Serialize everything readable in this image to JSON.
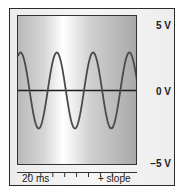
{
  "figure": {
    "vertical_scale": {
      "top_label": "5 V",
      "middle_label": "0 V",
      "bottom_label": "−5 V"
    },
    "horizontal": {
      "time_per_division": "20 ms",
      "trigger": "+ slope",
      "tick_count": 9
    },
    "waveform": {
      "type": "sine",
      "trace_color": "#4a4a4a",
      "baseline_color": "#1e1e1e",
      "screen_gradient": [
        "#b9b9b9",
        "#ffffff",
        "#a9a9a9"
      ]
    }
  }
}
